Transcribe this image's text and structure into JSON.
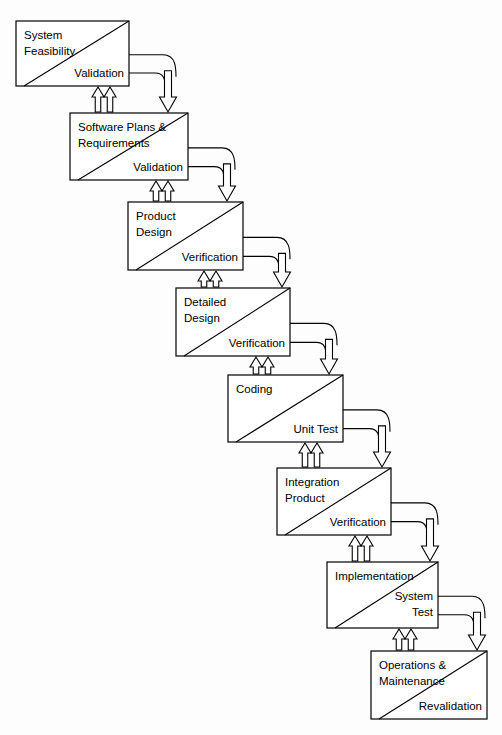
{
  "diagram": {
    "type": "flow-diagram",
    "canvas": {
      "width": 502,
      "height": 735
    },
    "colors": {
      "line": "#000000",
      "box_fill": "#ffffff",
      "background": "#fdfdfd",
      "arrow_fill": "#ffffff"
    },
    "stages": [
      {
        "id": "system-feasibility",
        "name_lines": [
          "System",
          "Feasibility"
        ],
        "gate_label": "Validation",
        "x": 16,
        "y": 21,
        "w": 113,
        "h": 65
      },
      {
        "id": "software-plans-requirements",
        "name_lines": [
          "Software Plans &",
          "Requirements"
        ],
        "gate_label": "Validation",
        "x": 70,
        "y": 113,
        "w": 118,
        "h": 67
      },
      {
        "id": "product-design",
        "name_lines": [
          "Product",
          "Design"
        ],
        "gate_label": "Verification",
        "x": 128,
        "y": 202,
        "w": 115,
        "h": 68
      },
      {
        "id": "detailed-design",
        "name_lines": [
          "Detailed",
          "Design"
        ],
        "gate_label": "Verification",
        "x": 176,
        "y": 288,
        "w": 114,
        "h": 68
      },
      {
        "id": "coding",
        "name_lines": [
          "Coding"
        ],
        "gate_label": "Unit Test",
        "x": 228,
        "y": 375,
        "w": 115,
        "h": 67
      },
      {
        "id": "integration-product",
        "name_lines": [
          "Integration",
          "Product"
        ],
        "gate_label": "Verification",
        "x": 277,
        "y": 468,
        "w": 114,
        "h": 67
      },
      {
        "id": "implementation",
        "name_lines": [
          "Implementation"
        ],
        "gate_label_lines": [
          "System",
          "Test"
        ],
        "gate_label": "System Test",
        "x": 327,
        "y": 562,
        "w": 111,
        "h": 66
      },
      {
        "id": "operations-maintenance",
        "name_lines": [
          "Operations &",
          "Maintenance"
        ],
        "gate_label": "Revalidation",
        "x": 371,
        "y": 651,
        "w": 116,
        "h": 68
      }
    ],
    "connectors": [
      {
        "id": "connector-1-2",
        "from": "system-feasibility",
        "to": "software-plans-requirements",
        "forward": "down-arrow",
        "feedback": "double-up-arrow"
      },
      {
        "id": "connector-2-3",
        "from": "software-plans-requirements",
        "to": "product-design",
        "forward": "down-arrow",
        "feedback": "double-up-arrow"
      },
      {
        "id": "connector-3-4",
        "from": "product-design",
        "to": "detailed-design",
        "forward": "down-arrow",
        "feedback": "double-up-arrow"
      },
      {
        "id": "connector-4-5",
        "from": "detailed-design",
        "to": "coding",
        "forward": "down-arrow",
        "feedback": "double-up-arrow"
      },
      {
        "id": "connector-5-6",
        "from": "coding",
        "to": "integration-product",
        "forward": "down-arrow",
        "feedback": "double-up-arrow"
      },
      {
        "id": "connector-6-7",
        "from": "integration-product",
        "to": "implementation",
        "forward": "down-arrow",
        "feedback": "double-up-arrow"
      },
      {
        "id": "connector-7-8",
        "from": "implementation",
        "to": "operations-maintenance",
        "forward": "down-arrow",
        "feedback": "double-up-arrow"
      }
    ]
  }
}
